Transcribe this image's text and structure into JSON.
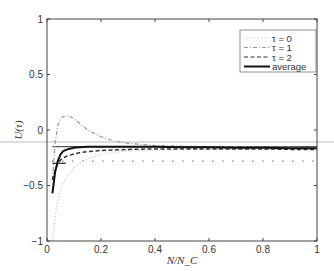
{
  "chart_data": {
    "type": "line",
    "title": "",
    "xlabel": "N/N_C",
    "ylabel": "U(τ)",
    "xlim": [
      0,
      1
    ],
    "ylim": [
      -1,
      1
    ],
    "xticks": [
      "0",
      "0.2",
      "0.4",
      "0.6",
      "0.8",
      "1"
    ],
    "yticks": [
      "-1",
      "-0.5",
      "0",
      "0.5",
      "1"
    ],
    "grid": false,
    "legend_position": "upper right",
    "legend": [
      "τ = 0",
      "τ = 1",
      "τ = 2",
      "average"
    ],
    "x": [
      0.02,
      0.03,
      0.04,
      0.05,
      0.06,
      0.08,
      0.1,
      0.12,
      0.15,
      0.2,
      0.25,
      0.3,
      0.4,
      0.5,
      0.6,
      0.7,
      0.8,
      0.9,
      1.0
    ],
    "series": [
      {
        "name": "τ = 0",
        "style": "dotted",
        "color": "#c8c8c8",
        "values": [
          -1.0,
          -0.78,
          -0.64,
          -0.55,
          -0.48,
          -0.4,
          -0.34,
          -0.3,
          -0.26,
          -0.22,
          -0.2,
          -0.19,
          -0.18,
          -0.175,
          -0.17,
          -0.17,
          -0.17,
          -0.17,
          -0.17
        ]
      },
      {
        "name": "τ = 1",
        "style": "dashdot",
        "color": "#9a9a9a",
        "values": [
          -0.45,
          -0.12,
          0.04,
          0.1,
          0.12,
          0.13,
          0.1,
          0.06,
          0.0,
          -0.06,
          -0.1,
          -0.12,
          -0.14,
          -0.145,
          -0.15,
          -0.15,
          -0.155,
          -0.155,
          -0.16
        ]
      },
      {
        "name": "τ = 2",
        "style": "dashed",
        "color": "#333333",
        "values": [
          -0.45,
          -0.36,
          -0.3,
          -0.27,
          -0.25,
          -0.23,
          -0.215,
          -0.205,
          -0.195,
          -0.185,
          -0.18,
          -0.175,
          -0.17,
          -0.17,
          -0.17,
          -0.17,
          -0.17,
          -0.175,
          -0.175
        ]
      },
      {
        "name": "average",
        "style": "solid",
        "color": "#111111",
        "values": [
          -0.57,
          -0.38,
          -0.28,
          -0.22,
          -0.19,
          -0.17,
          -0.16,
          -0.155,
          -0.15,
          -0.15,
          -0.15,
          -0.15,
          -0.15,
          -0.155,
          -0.155,
          -0.16,
          -0.16,
          -0.165,
          -0.165
        ]
      }
    ],
    "reference_lines": [
      {
        "y": -0.15,
        "x_from": 0.02,
        "x_to": 1.0,
        "style": "solid",
        "color": "#555555"
      },
      {
        "y": -0.3,
        "x_from": 0.02,
        "x_to": 0.07,
        "style": "solid",
        "color": "#333333"
      },
      {
        "y": -0.28,
        "x_from": 0.02,
        "x_to": 1.0,
        "style": "dotted",
        "color": "#444444"
      }
    ]
  }
}
